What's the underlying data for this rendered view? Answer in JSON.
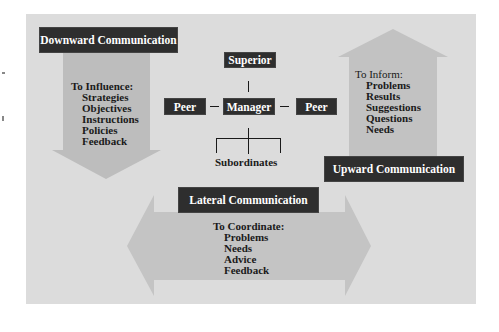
{
  "colors": {
    "panel": "#dcdcdc",
    "arrow": "#bdbdbd",
    "box": "#2e2e2e",
    "box_text": "#ffffff",
    "text": "#1a1a1a"
  },
  "downward": {
    "title": "Downward Communication",
    "heading": "To Influence:",
    "items": [
      "Strategies",
      "Objectives",
      "Instructions",
      "Policies",
      "Feedback"
    ]
  },
  "upward": {
    "title": "Upward Communication",
    "heading": "To Inform:",
    "items": [
      "Problems",
      "Results",
      "Suggestions",
      "Questions",
      "Needs"
    ]
  },
  "lateral": {
    "title": "Lateral Communication",
    "heading": "To Coordinate:",
    "items": [
      "Problems",
      "Needs",
      "Advice",
      "Feedback"
    ]
  },
  "org_chart": {
    "superior": "Superior",
    "manager": "Manager",
    "peer_left": "Peer",
    "peer_right": "Peer",
    "subordinates": "Subordinates"
  }
}
